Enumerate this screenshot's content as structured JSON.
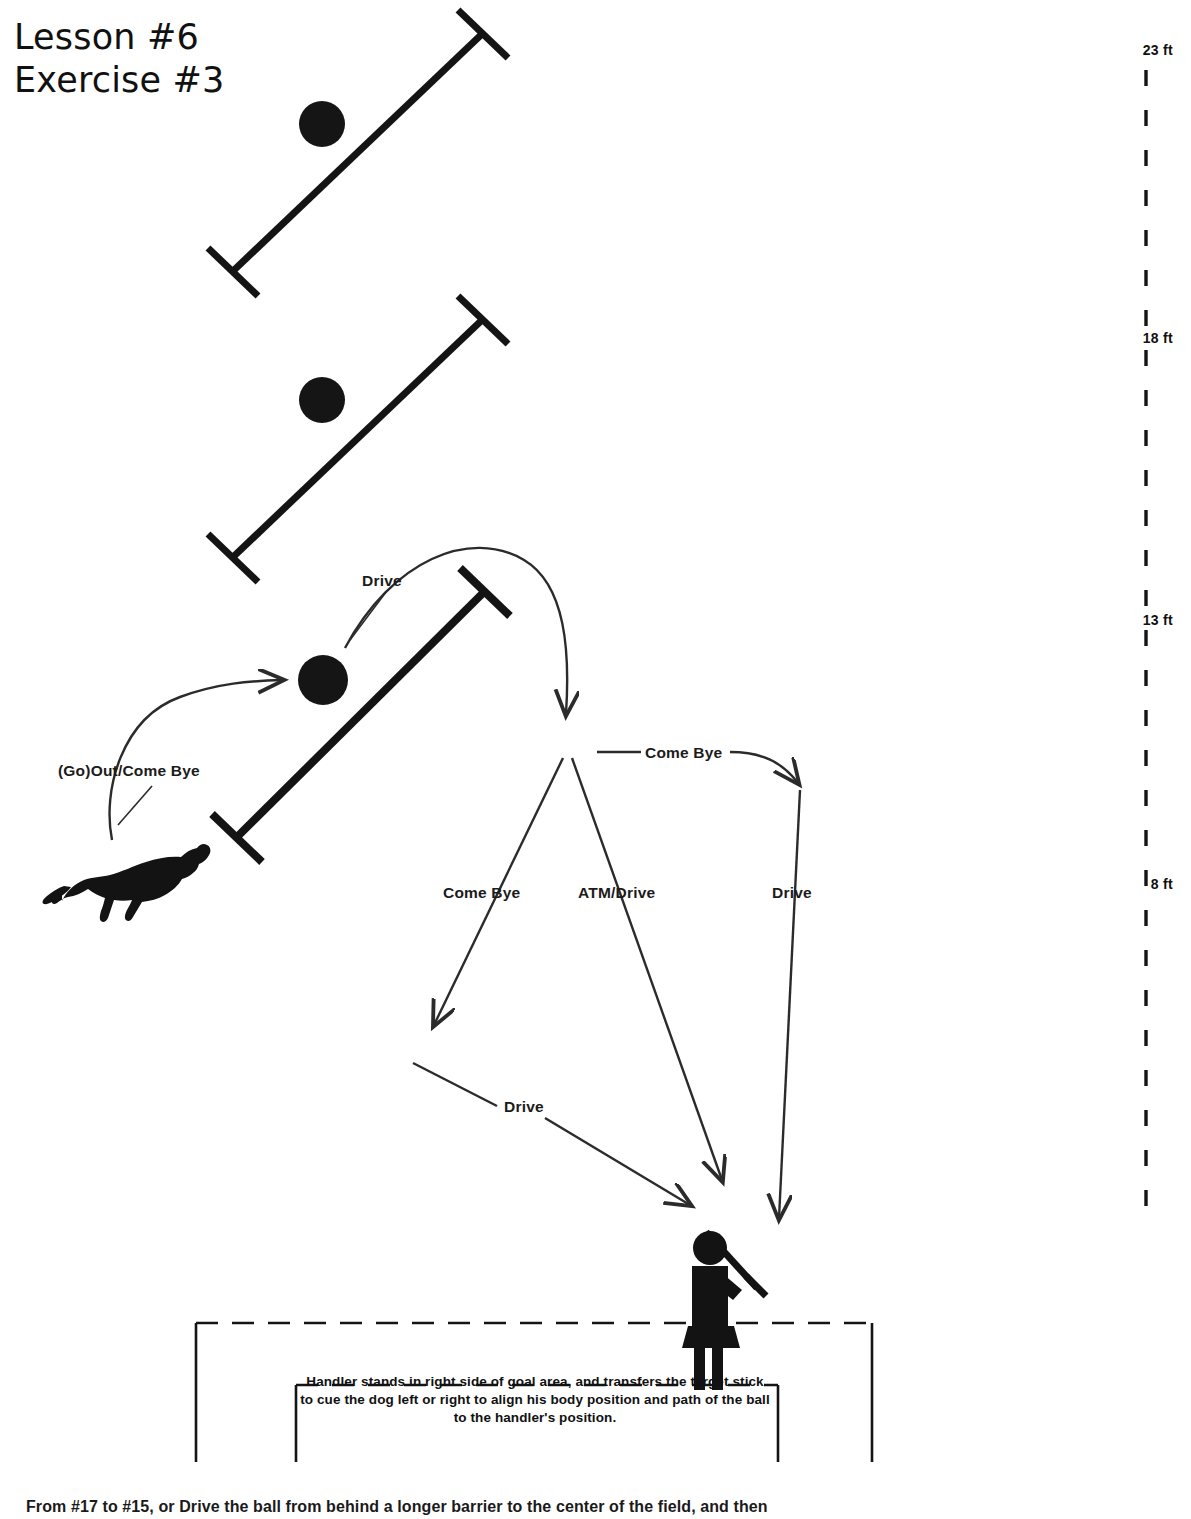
{
  "title": {
    "line1": "Lesson #6",
    "line2": "Exercise #3"
  },
  "scale": {
    "unit": "ft",
    "ticks": [
      {
        "label": "23 ft",
        "y": 50
      },
      {
        "label": "18 ft",
        "y": 338
      },
      {
        "label": "13 ft",
        "y": 620
      },
      {
        "label": "8 ft",
        "y": 884
      }
    ],
    "line_x": 1146,
    "line_top": 70,
    "line_bottom": 1230
  },
  "flow_labels": [
    {
      "name": "go-out-come-bye",
      "text": "(Go)Out/Come Bye",
      "x": 58,
      "y": 773
    },
    {
      "name": "drive-top",
      "text": "Drive",
      "x": 362,
      "y": 573
    },
    {
      "name": "come-bye-upper",
      "text": "Come Bye",
      "x": 641,
      "y": 746
    },
    {
      "name": "come-bye-left",
      "text": "Come Bye",
      "x": 443,
      "y": 885
    },
    {
      "name": "atm-drive",
      "text": "ATM/Drive",
      "x": 578,
      "y": 885
    },
    {
      "name": "drive-right",
      "text": "Drive",
      "x": 773,
      "y": 885
    },
    {
      "name": "drive-lower-left",
      "text": "Drive",
      "x": 504,
      "y": 1098
    }
  ],
  "goal_area": {
    "caption": "Handler stands in right side of goal area, and transfers the target stick to cue the dog left or right to align his body position and path of the ball to the handler's position."
  },
  "bottom_note": {
    "text": "From #17 to #15, or Drive the ball from behind a longer barrier to the center of the field, and then"
  },
  "field_elements": {
    "barriers": [
      {
        "name": "barrier-top",
        "x1": 232,
        "y1": 272,
        "x2": 482,
        "y2": 34
      },
      {
        "name": "barrier-middle",
        "x1": 232,
        "y1": 558,
        "x2": 482,
        "y2": 320
      },
      {
        "name": "barrier-lower",
        "x1": 236,
        "y1": 838,
        "x2": 484,
        "y2": 592
      }
    ],
    "balls": [
      {
        "name": "ball-top",
        "cx": 322,
        "cy": 124,
        "r": 23
      },
      {
        "name": "ball-middle",
        "cx": 322,
        "cy": 400,
        "r": 23
      },
      {
        "name": "ball-lower",
        "cx": 323,
        "cy": 680,
        "r": 25
      }
    ],
    "dog": {
      "name": "dog-silhouette",
      "x": 62,
      "y": 855
    },
    "handler": {
      "name": "handler-figure",
      "x": 690,
      "y": 1230
    }
  },
  "colors": {
    "ink": "#111111",
    "line": "#2b2b2b",
    "background": "#ffffff"
  }
}
